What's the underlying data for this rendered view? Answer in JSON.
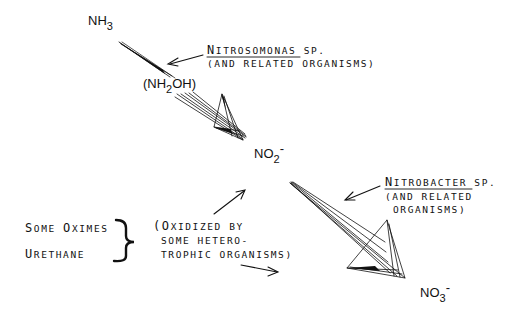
{
  "diagram": {
    "nodes": {
      "ammonia": {
        "base": "NH",
        "sub": "3",
        "sup": ""
      },
      "hydroxylamine": {
        "open": "(NH",
        "sub": "2",
        "rest": "OH)"
      },
      "nitrite": {
        "base": "NO",
        "sub": "2",
        "sup": "-"
      },
      "nitrate": {
        "base": "NO",
        "sub": "3",
        "sup": "-"
      }
    },
    "labels": {
      "nitrosomonas": {
        "line1_cap": "N",
        "line1_rest": "ITROSOMONAS",
        "line1_suffix": " SP.",
        "line2": "(AND RELATED ORGANISMS)"
      },
      "nitrobacter": {
        "line1_cap": "N",
        "line1_rest": "ITROBACTER",
        "line1_suffix": " SP.",
        "line2": "(AND RELATED",
        "line3": "ORGANISMS)"
      },
      "sources": {
        "item1_cap1": "S",
        "item1_rest1": "OME ",
        "item1_cap2": "O",
        "item1_rest2": "XIMES",
        "item2_cap": "U",
        "item2_rest": "RETHANE"
      },
      "heterotrophic": {
        "line1_open": "(",
        "line1_cap": "O",
        "line1_rest": "XIDIZED BY",
        "line2": "SOME HETERO-",
        "line3": "TROPHIC ORGANISMS)"
      }
    },
    "icons": {
      "arrow_fan": "hand-drawn-fan-arrow",
      "pointer": "simple-arrow",
      "brace": "curly-brace"
    }
  }
}
